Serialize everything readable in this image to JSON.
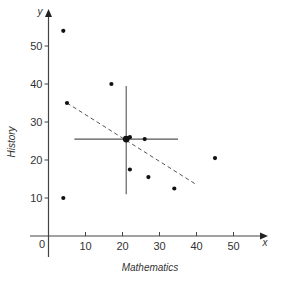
{
  "chart_data": {
    "type": "scatter",
    "title": "",
    "xlabel": "Mathematics",
    "ylabel": "History",
    "x_axis_letter": "x",
    "y_axis_letter": "y",
    "xlim": [
      -5,
      58
    ],
    "ylim": [
      -5,
      60
    ],
    "x_ticks": [
      10,
      20,
      30,
      40,
      50
    ],
    "y_ticks": [
      10,
      20,
      30,
      40,
      50
    ],
    "origin_label": "0",
    "grid": false,
    "legend": null,
    "points": [
      {
        "x": 4,
        "y": 54
      },
      {
        "x": 17,
        "y": 40
      },
      {
        "x": 5,
        "y": 35
      },
      {
        "x": 22,
        "y": 26
      },
      {
        "x": 26,
        "y": 25.5
      },
      {
        "x": 22,
        "y": 17.5
      },
      {
        "x": 27,
        "y": 15.5
      },
      {
        "x": 34,
        "y": 12.5
      },
      {
        "x": 45,
        "y": 20.5
      },
      {
        "x": 4,
        "y": 10
      }
    ],
    "mean_point": {
      "x": 21,
      "y": 25.5
    },
    "mean_cross": {
      "vertical": {
        "x": 21,
        "y_from": 11,
        "y_to": 39.5
      },
      "horizontal": {
        "y": 25.5,
        "x_from": 7,
        "x_to": 35
      }
    },
    "trend_line": {
      "style": "dashed",
      "from": {
        "x": 5,
        "y": 35
      },
      "to": {
        "x": 40,
        "y": 13.5
      }
    }
  }
}
